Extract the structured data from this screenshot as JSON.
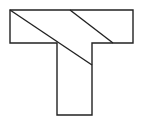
{
  "diagram": {
    "type": "t-shape-dissection",
    "stroke_color": "#222222",
    "fill_color": "#ffffff",
    "outline_points": [
      [
        10,
        10
      ],
      [
        133,
        10
      ],
      [
        133,
        43
      ],
      [
        92,
        43
      ],
      [
        92,
        115
      ],
      [
        57,
        115
      ],
      [
        57,
        43
      ],
      [
        10,
        43
      ]
    ],
    "cut_lines": [
      {
        "from": [
          10,
          10
        ],
        "to": [
          92,
          65
        ]
      },
      {
        "from": [
          70,
          10
        ],
        "to": [
          113,
          43
        ]
      }
    ]
  }
}
